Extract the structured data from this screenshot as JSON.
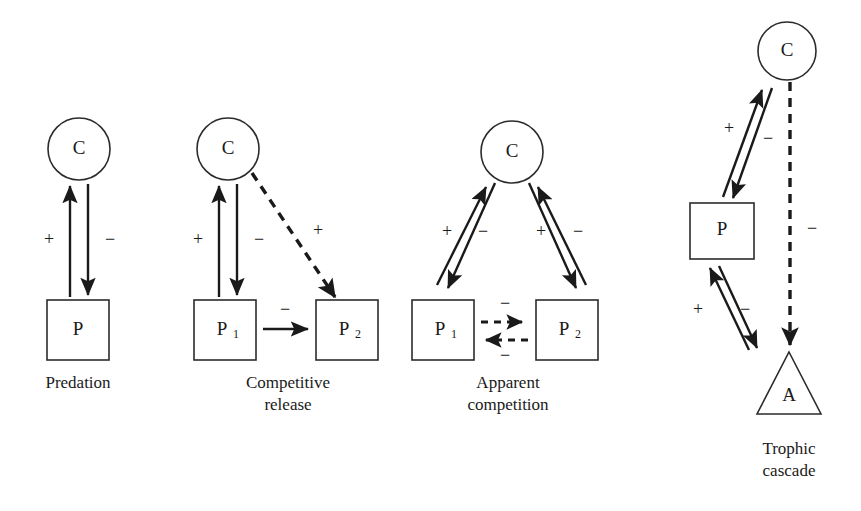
{
  "figure": {
    "background_color": "#ffffff",
    "ink_color": "#1a1a1a",
    "panel_count": 4
  },
  "panels": [
    {
      "id": "predation",
      "caption_lines": [
        "Predation"
      ],
      "nodes": [
        {
          "id": "c",
          "shape": "circle",
          "label": "C",
          "sub": ""
        },
        {
          "id": "p",
          "shape": "square",
          "label": "P",
          "sub": ""
        }
      ],
      "edges": [
        {
          "from": "p",
          "to": "c",
          "style": "solid",
          "sign": "+"
        },
        {
          "from": "c",
          "to": "p",
          "style": "solid",
          "sign": "−"
        }
      ]
    },
    {
      "id": "competitive-release",
      "caption_lines": [
        "Competitive",
        "release"
      ],
      "nodes": [
        {
          "id": "c",
          "shape": "circle",
          "label": "C",
          "sub": ""
        },
        {
          "id": "p1",
          "shape": "square",
          "label": "P",
          "sub": "1"
        },
        {
          "id": "p2",
          "shape": "square",
          "label": "P",
          "sub": "2"
        }
      ],
      "edges": [
        {
          "from": "p1",
          "to": "c",
          "style": "solid",
          "sign": "+"
        },
        {
          "from": "c",
          "to": "p1",
          "style": "solid",
          "sign": "−"
        },
        {
          "from": "c",
          "to": "p2",
          "style": "dashed",
          "sign": "+"
        },
        {
          "from": "p1",
          "to": "p2",
          "style": "solid",
          "sign": "−"
        }
      ]
    },
    {
      "id": "apparent-competition",
      "caption_lines": [
        "Apparent",
        "competition"
      ],
      "nodes": [
        {
          "id": "c",
          "shape": "circle",
          "label": "C",
          "sub": ""
        },
        {
          "id": "p1",
          "shape": "square",
          "label": "P",
          "sub": "1"
        },
        {
          "id": "p2",
          "shape": "square",
          "label": "P",
          "sub": "2"
        }
      ],
      "edges": [
        {
          "from": "p1",
          "to": "c",
          "style": "solid",
          "sign": "+"
        },
        {
          "from": "c",
          "to": "p1",
          "style": "solid",
          "sign": "−"
        },
        {
          "from": "p2",
          "to": "c",
          "style": "solid",
          "sign": "+"
        },
        {
          "from": "c",
          "to": "p2",
          "style": "solid",
          "sign": "−"
        },
        {
          "from": "p1",
          "to": "p2",
          "style": "dashed",
          "sign": "−"
        },
        {
          "from": "p2",
          "to": "p1",
          "style": "dashed",
          "sign": "−"
        }
      ]
    },
    {
      "id": "trophic-cascade",
      "caption_lines": [
        "Trophic",
        "cascade"
      ],
      "nodes": [
        {
          "id": "c",
          "shape": "circle",
          "label": "C",
          "sub": ""
        },
        {
          "id": "p",
          "shape": "square",
          "label": "P",
          "sub": ""
        },
        {
          "id": "a",
          "shape": "triangle",
          "label": "A",
          "sub": ""
        }
      ],
      "edges": [
        {
          "from": "p",
          "to": "c",
          "style": "solid",
          "sign": "+"
        },
        {
          "from": "c",
          "to": "p",
          "style": "solid",
          "sign": "−"
        },
        {
          "from": "a",
          "to": "p",
          "style": "solid",
          "sign": "+"
        },
        {
          "from": "p",
          "to": "a",
          "style": "solid",
          "sign": "−"
        },
        {
          "from": "c",
          "to": "a",
          "style": "dashed",
          "sign": "−"
        }
      ]
    }
  ],
  "labels": {
    "p1_panel": {
      "node_c": "C",
      "node_p": "P",
      "sign_plus": "+",
      "sign_minus": "−",
      "caption": "Predation"
    },
    "p2_panel": {
      "node_c": "C",
      "node_p1": "P",
      "node_p1_sub": "1",
      "node_p2": "P",
      "node_p2_sub": "2",
      "sign_plus_left": "+",
      "sign_minus_left": "−",
      "sign_plus_diag": "+",
      "sign_minus_mid": "−",
      "caption_line1": "Competitive",
      "caption_line2": "release"
    },
    "p3_panel": {
      "node_c": "C",
      "node_p1": "P",
      "node_p1_sub": "1",
      "node_p2": "P",
      "node_p2_sub": "2",
      "sign_plus_left": "+",
      "sign_minus_left": "−",
      "sign_plus_right": "+",
      "sign_minus_right": "−",
      "sign_minus_top": "−",
      "sign_minus_bottom": "−",
      "caption_line1": "Apparent",
      "caption_line2": "competition"
    },
    "p4_panel": {
      "node_c": "C",
      "node_p": "P",
      "node_a": "A",
      "sign_plus_upper": "+",
      "sign_minus_upper": "−",
      "sign_plus_lower": "+",
      "sign_minus_lower": "−",
      "sign_minus_cascade": "−",
      "caption_line1": "Trophic",
      "caption_line2": "cascade"
    }
  }
}
